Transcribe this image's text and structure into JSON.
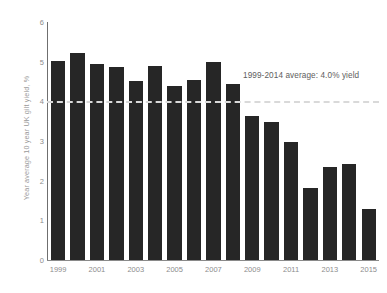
{
  "chart_data": {
    "type": "bar",
    "title": "",
    "xlabel": "",
    "ylabel": "Year average 10 year UK gilt yield, %",
    "ylim": [
      0,
      6
    ],
    "ytick_labels": [
      "0",
      "1",
      "2",
      "3",
      "4",
      "5",
      "6"
    ],
    "ytick_values": [
      0,
      1,
      2,
      3,
      4,
      5,
      6
    ],
    "grid": false,
    "legend": null,
    "bar_color": "#262626",
    "categories": [
      "1999",
      "2000",
      "2001",
      "2002",
      "2003",
      "2004",
      "2005",
      "2006",
      "2007",
      "2008",
      "2009",
      "2010",
      "2011",
      "2012",
      "2013",
      "2014",
      "2015"
    ],
    "values": [
      5.01,
      5.22,
      4.94,
      4.86,
      4.51,
      4.88,
      4.39,
      4.53,
      5.0,
      4.44,
      3.64,
      3.47,
      2.97,
      1.82,
      2.33,
      2.42,
      1.29
    ],
    "xtick_labels": [
      "1999",
      "2001",
      "2003",
      "2005",
      "2007",
      "2009",
      "2011",
      "2013",
      "2015"
    ],
    "xtick_categories": [
      "1999",
      "2001",
      "2003",
      "2005",
      "2007",
      "2009",
      "2011",
      "2013",
      "2015"
    ],
    "reference_line": {
      "value": 4.0,
      "label": "1999-2014 average: 4.0% yield",
      "style": "dashed",
      "color": "#d9d9d9"
    }
  }
}
